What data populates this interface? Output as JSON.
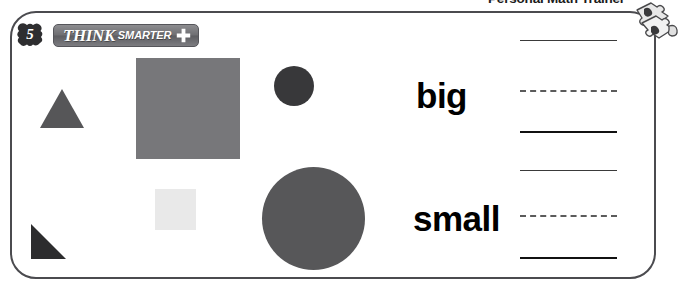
{
  "banner": {
    "title": "Personal Math Trainer",
    "icon": "puzzle-pieces-icon"
  },
  "header": {
    "lesson_number": "5",
    "badge_icon": "starburst-badge-icon",
    "brand_primary": "THINK",
    "brand_secondary": "SMARTER",
    "plus_icon": "plus-icon"
  },
  "shapes": [
    {
      "name": "triangle-medium",
      "type": "triangle",
      "size": "big",
      "color": "#565658"
    },
    {
      "name": "square-large",
      "type": "square",
      "size": "big",
      "color": "#77777a"
    },
    {
      "name": "circle-small",
      "type": "circle",
      "size": "small",
      "color": "#38383a"
    },
    {
      "name": "square-small",
      "type": "square",
      "size": "small",
      "color": "#e9e9e9"
    },
    {
      "name": "circle-large",
      "type": "circle",
      "size": "big",
      "color": "#575759"
    },
    {
      "name": "triangle-right",
      "type": "right-triangle",
      "size": "small",
      "color": "#2c2c2e"
    }
  ],
  "labels": {
    "big": "big",
    "small": "small"
  },
  "answer_lines": [
    {
      "id": "answer-line-1",
      "style": "solid-thin"
    },
    {
      "id": "answer-line-2",
      "style": "dashed"
    },
    {
      "id": "answer-line-3",
      "style": "solid-thick"
    },
    {
      "id": "answer-line-4",
      "style": "solid-thin"
    },
    {
      "id": "answer-line-5",
      "style": "dashed"
    },
    {
      "id": "answer-line-6",
      "style": "solid-thick"
    }
  ],
  "colors": {
    "frame_border": "#4b4b4f",
    "pill_background": "#6e6e72",
    "text": "#000000"
  }
}
